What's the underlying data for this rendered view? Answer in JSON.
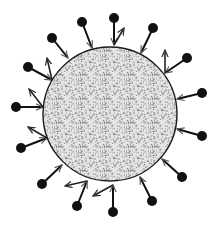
{
  "figure": {
    "title": "",
    "width": 218,
    "height": 226,
    "background": "#ffffff",
    "ink_color": "#111111",
    "body": {
      "shape": "circle",
      "cx": 110,
      "cy": 114,
      "r": 67,
      "fill": "#e4e4e4",
      "texture": "stipple",
      "stroke": "#1a1a1a"
    },
    "dot_radius": 5,
    "protrusions": [
      {
        "dot": [
          52,
          38
        ],
        "base": [
          68,
          58
        ],
        "arrow": null
      },
      {
        "dot": [
          82,
          22
        ],
        "base": [
          92,
          48
        ],
        "arrow": null
      },
      {
        "dot": [
          114,
          18
        ],
        "base": [
          114,
          45
        ],
        "arrow": [
          124,
          28
        ]
      },
      {
        "dot": [
          153,
          28
        ],
        "base": [
          141,
          53
        ],
        "arrow": null
      },
      {
        "dot": [
          187,
          58
        ],
        "base": [
          165,
          73
        ],
        "arrow": [
          165,
          50
        ]
      },
      {
        "dot": [
          202,
          93
        ],
        "base": [
          177,
          99
        ],
        "arrow": null
      },
      {
        "dot": [
          202,
          136
        ],
        "base": [
          177,
          129
        ],
        "arrow": null
      },
      {
        "dot": [
          182,
          177
        ],
        "base": [
          162,
          159
        ],
        "arrow": null
      },
      {
        "dot": [
          152,
          201
        ],
        "base": [
          140,
          177
        ],
        "arrow": null
      },
      {
        "dot": [
          113,
          212
        ],
        "base": [
          113,
          185
        ],
        "arrow": [
          93,
          196
        ]
      },
      {
        "dot": [
          77,
          206
        ],
        "base": [
          87,
          181
        ],
        "arrow": [
          65,
          186
        ]
      },
      {
        "dot": [
          42,
          184
        ],
        "base": [
          62,
          165
        ],
        "arrow": null
      },
      {
        "dot": [
          21,
          148
        ],
        "base": [
          47,
          138
        ],
        "arrow": [
          28,
          127
        ]
      },
      {
        "dot": [
          16,
          107
        ],
        "base": [
          43,
          107
        ],
        "arrow": [
          29,
          89
        ]
      },
      {
        "dot": [
          28,
          67
        ],
        "base": [
          52,
          80
        ],
        "arrow": [
          47,
          58
        ]
      }
    ]
  }
}
